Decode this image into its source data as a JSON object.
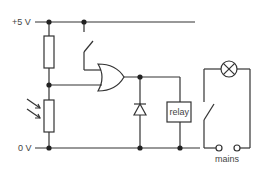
{
  "diagram": {
    "type": "circuit",
    "labels": {
      "supply_positive": "+5 V",
      "supply_ground": "0 V",
      "relay": "relay",
      "mains": "mains"
    },
    "components": [
      {
        "id": "resistor",
        "kind": "fixed-resistor"
      },
      {
        "id": "ldr",
        "kind": "light-dependent-resistor"
      },
      {
        "id": "push-switch",
        "kind": "switch"
      },
      {
        "id": "or-gate",
        "kind": "logic-or-gate"
      },
      {
        "id": "diode",
        "kind": "diode"
      },
      {
        "id": "relay-coil",
        "kind": "relay",
        "label": "relay"
      },
      {
        "id": "relay-switch",
        "kind": "switch"
      },
      {
        "id": "lamp",
        "kind": "lamp"
      },
      {
        "id": "mains-terminals",
        "kind": "terminals",
        "label": "mains"
      }
    ],
    "colors": {
      "wire": "#333333",
      "text": "#444444",
      "background": "#ffffff"
    }
  }
}
